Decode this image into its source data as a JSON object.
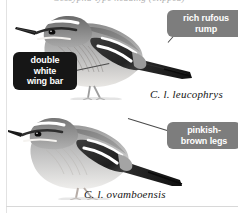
{
  "page": {
    "heading": "Cossypha-type heading (clipped)",
    "background_color": "#ffffff"
  },
  "colors": {
    "callout_dark": "#161616",
    "callout_grey": "#7d7d7d",
    "callout_text": "#ffffff",
    "leader_line": "#4a4a4a",
    "caption_text": "#141414",
    "rule": "#e2e2e2"
  },
  "illustrations": [
    {
      "id": "bird-upper",
      "name": "white-browed-scrub-robin-leucophrys",
      "style": "grayscale-field-guide-painting",
      "caption": "C. l. leucophrys"
    },
    {
      "id": "bird-lower",
      "name": "white-browed-scrub-robin-ovamboensis",
      "style": "grayscale-field-guide-painting",
      "caption": "C. l. ovamboensis"
    }
  ],
  "callouts": [
    {
      "id": "callout-rump",
      "name": "rich-rufous-rump",
      "text": "rich rufous\nrump",
      "style": "grey"
    },
    {
      "id": "callout-wing",
      "name": "double-white-wing-bar",
      "text": "double\nwhite\nwing bar",
      "style": "dark"
    },
    {
      "id": "callout-legs",
      "name": "pinkish-brown-legs",
      "text": "pinkish-\nbrown legs",
      "style": "grey"
    }
  ],
  "captions": {
    "upper": "C. l. leucophrys",
    "lower": "C. l. ovamboensis"
  }
}
